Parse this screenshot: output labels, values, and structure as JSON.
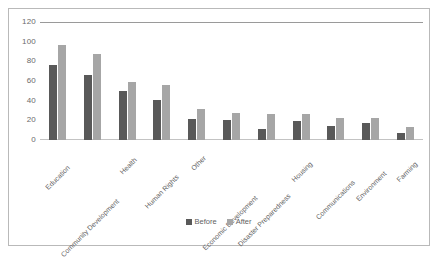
{
  "chart_data": {
    "type": "bar",
    "title": "",
    "subtitle": "",
    "xlabel": "",
    "ylabel": "",
    "ylim": [
      0,
      120
    ],
    "yticks": [
      0,
      20,
      40,
      60,
      80,
      100,
      120
    ],
    "grid": "horizontal-top-rule-only",
    "legend_position": "bottom-center",
    "orientation": "vertical-grouped",
    "categories": [
      "Education",
      "Community Development",
      "Health",
      "Human Rights",
      "Other",
      "Economic Development",
      "Disaster Preparedness",
      "Housing",
      "Communications",
      "Environment",
      "Farming"
    ],
    "series": [
      {
        "name": "Before",
        "color": "#595959",
        "values": [
          76,
          66,
          50,
          41,
          21,
          20,
          11,
          19,
          14,
          17,
          7
        ]
      },
      {
        "name": "After",
        "color": "#a6a6a6",
        "values": [
          97,
          87,
          59,
          56,
          32,
          27,
          26,
          26,
          22,
          22,
          13
        ]
      }
    ]
  },
  "legend": {
    "items": [
      {
        "label": "Before",
        "color": "#595959"
      },
      {
        "label": "After",
        "color": "#a6a6a6"
      }
    ]
  },
  "colors": {
    "before": "#595959",
    "after": "#a6a6a6",
    "axis_text": "#6b6b6b",
    "gridline": "#d6d6d6",
    "frame": "#b9b9b9",
    "background": "#ffffff"
  }
}
